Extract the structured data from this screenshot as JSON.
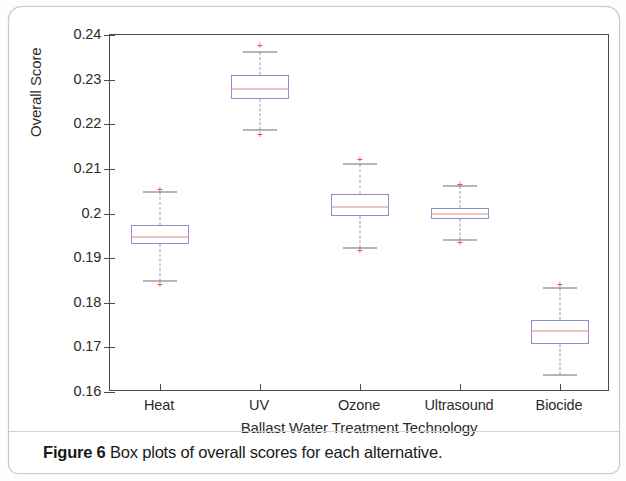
{
  "caption": {
    "label": "Figure 6",
    "text": "Box plots of overall scores for each alternative."
  },
  "chart_data": {
    "type": "box",
    "title": "",
    "xlabel": "Ballast Water Treatment Technology",
    "ylabel": "Overall Score",
    "ylim": [
      0.16,
      0.24
    ],
    "yticks": [
      "0.16",
      "0.17",
      "0.18",
      "0.19",
      "0.2",
      "0.21",
      "0.22",
      "0.23",
      "0.24"
    ],
    "ytick_values": [
      0.16,
      0.17,
      0.18,
      0.19,
      0.2,
      0.21,
      0.22,
      0.23,
      0.24
    ],
    "grid": false,
    "legend": null,
    "categories": [
      "Heat",
      "UV",
      "Ozone",
      "Ultrasound",
      "Biocide"
    ],
    "boxes": [
      {
        "category": "Heat",
        "whisker_low": 0.1849,
        "q1": 0.1932,
        "median": 0.1947,
        "q3": 0.1975,
        "whisker_high": 0.2048,
        "outliers": [
          0.2056,
          0.1843
        ]
      },
      {
        "category": "UV",
        "whisker_low": 0.2188,
        "q1": 0.2256,
        "median": 0.2279,
        "q3": 0.231,
        "whisker_high": 0.2362,
        "outliers": [
          0.2378,
          0.2178
        ]
      },
      {
        "category": "Ozone",
        "whisker_low": 0.1922,
        "q1": 0.1995,
        "median": 0.2015,
        "q3": 0.2043,
        "whisker_high": 0.2112,
        "outliers": [
          0.2122,
          0.1918
        ]
      },
      {
        "category": "Ultrasound",
        "whisker_low": 0.1941,
        "q1": 0.1988,
        "median": 0.2,
        "q3": 0.2012,
        "whisker_high": 0.2061,
        "outliers": [
          0.2065,
          0.1936
        ]
      },
      {
        "category": "Biocide",
        "whisker_low": 0.1638,
        "q1": 0.1707,
        "median": 0.1737,
        "q3": 0.1762,
        "whisker_high": 0.1833,
        "outliers": [
          0.1843
        ]
      }
    ],
    "colors": {
      "box_edge": "#8e8ecb",
      "median": "#e08a86",
      "whisker": "#9b9bd0",
      "cap": "#6f6f6f",
      "outlier": "#e2554d",
      "axis": "#4c4c4c"
    }
  }
}
